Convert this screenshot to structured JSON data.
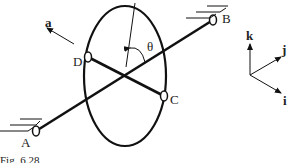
{
  "figure": {
    "caption": "Fig. 6.28",
    "labels": {
      "A": "A",
      "B": "B",
      "C": "C",
      "D": "D",
      "theta": "θ",
      "a": "a"
    },
    "axes": {
      "i": "i",
      "j": "j",
      "k": "k"
    },
    "colors": {
      "stroke": "#111111",
      "background": "#ffffff"
    }
  }
}
